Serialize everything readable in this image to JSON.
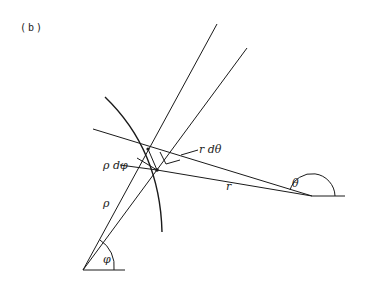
{
  "figure": {
    "panel_label": "(b)",
    "labels": {
      "r_dtheta": "r dθ",
      "rho_dphi": "ρ dφ",
      "rho": "ρ",
      "r": "r",
      "theta": "θ",
      "phi": "φ"
    },
    "colors": {
      "stroke": "#1a1a1a",
      "background": "#ffffff"
    }
  }
}
